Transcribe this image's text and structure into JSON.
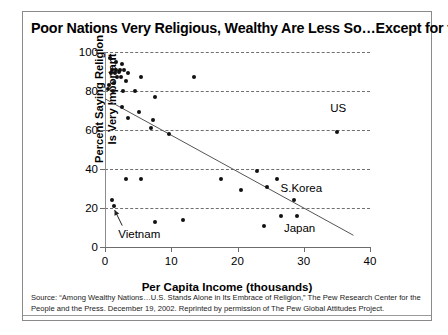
{
  "figure": {
    "title": "Poor Nations Very Religious, Wealthy Are Less So…Except for the U.S.",
    "source_line1": "Source: “Among Wealthy Nations…U.S. Stands Alone in Its Embrace of Religion,” The Pew Research Center for the People and",
    "source_line2": "the Press. December 19, 2002. Reprinted by permission of The Pew Global Attitudes Project."
  },
  "chart_data": {
    "type": "scatter",
    "title": "Poor Nations Very Religious, Wealthy Are Less So…Except for the U.S.",
    "xlabel": "Per Capita Income (thousands)",
    "ylabel": "Percent Saying Religion Is Very Important",
    "xlim": [
      0,
      40
    ],
    "ylim": [
      0,
      100
    ],
    "xticks": [
      0,
      10,
      20,
      30,
      40
    ],
    "yticks": [
      0,
      20,
      40,
      60,
      80,
      100
    ],
    "xtick_labels": [
      "0",
      "10",
      "20",
      "30",
      "40"
    ],
    "ytick_labels": [
      "0",
      "20",
      "40",
      "60",
      "80",
      "100"
    ],
    "grid": "horizontal-dashed",
    "legend": "none",
    "points": [
      {
        "x": 0.7,
        "y": 97
      },
      {
        "x": 1.6,
        "y": 95
      },
      {
        "x": 2.6,
        "y": 94
      },
      {
        "x": 1.1,
        "y": 91
      },
      {
        "x": 1.7,
        "y": 91
      },
      {
        "x": 2.2,
        "y": 91
      },
      {
        "x": 2.9,
        "y": 91
      },
      {
        "x": 0.9,
        "y": 89
      },
      {
        "x": 1.5,
        "y": 89
      },
      {
        "x": 2.1,
        "y": 90
      },
      {
        "x": 3.5,
        "y": 89
      },
      {
        "x": 1.8,
        "y": 87
      },
      {
        "x": 2.4,
        "y": 87
      },
      {
        "x": 5.5,
        "y": 87
      },
      {
        "x": 13.5,
        "y": 87
      },
      {
        "x": 0.6,
        "y": 83
      },
      {
        "x": 1.3,
        "y": 84
      },
      {
        "x": 3.1,
        "y": 85
      },
      {
        "x": 0.5,
        "y": 81
      },
      {
        "x": 1.2,
        "y": 80
      },
      {
        "x": 2.7,
        "y": 80
      },
      {
        "x": 4.6,
        "y": 80
      },
      {
        "x": 7.6,
        "y": 77
      },
      {
        "x": 2.5,
        "y": 72
      },
      {
        "x": 5.2,
        "y": 69
      },
      {
        "x": 3.4,
        "y": 66
      },
      {
        "x": 7.3,
        "y": 65
      },
      {
        "x": 6.9,
        "y": 61
      },
      {
        "x": 9.6,
        "y": 58
      },
      {
        "x": 35.0,
        "y": 59
      },
      {
        "x": 23.0,
        "y": 39
      },
      {
        "x": 3.2,
        "y": 35
      },
      {
        "x": 5.4,
        "y": 35
      },
      {
        "x": 17.5,
        "y": 35
      },
      {
        "x": 26.0,
        "y": 35
      },
      {
        "x": 20.5,
        "y": 29
      },
      {
        "x": 24.5,
        "y": 31
      },
      {
        "x": 28.5,
        "y": 24
      },
      {
        "x": 1.1,
        "y": 24
      },
      {
        "x": 1.3,
        "y": 21
      },
      {
        "x": 7.6,
        "y": 13
      },
      {
        "x": 11.8,
        "y": 14
      },
      {
        "x": 24.0,
        "y": 11
      },
      {
        "x": 26.5,
        "y": 16
      },
      {
        "x": 29.0,
        "y": 16
      }
    ],
    "trendline": {
      "x0": 0,
      "y0": 76,
      "x1": 37.5,
      "y1": 6
    },
    "annotations": [
      {
        "label": "US",
        "x": 34.0,
        "y": 71
      },
      {
        "label": "S.Korea",
        "x": 26.5,
        "y": 30
      },
      {
        "label": "Japan",
        "x": 27.0,
        "y": 9
      },
      {
        "label": "Vietnam",
        "x": 2.0,
        "y": 6
      }
    ],
    "callout": {
      "label": "Vietnam",
      "target_x": 1.3,
      "target_y": 21
    }
  }
}
